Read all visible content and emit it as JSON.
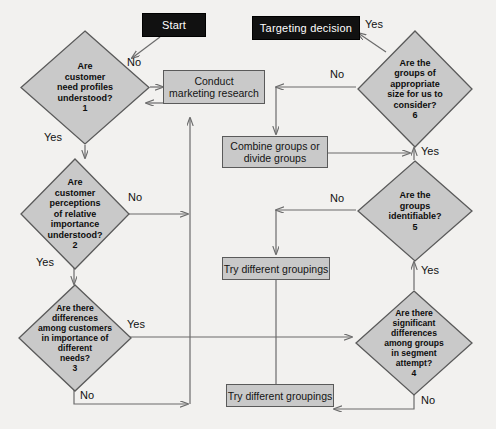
{
  "diagram": {
    "background_color": "#f2f1ef",
    "shape_fill": "#c9c9c9",
    "shape_stroke": "#5a5a5a",
    "terminator_fill": "#111111",
    "terminator_text_color": "#ffffff",
    "line_color": "#6b6b6b"
  },
  "terminators": [
    {
      "id": "start",
      "label": "Start"
    },
    {
      "id": "targeting-decision",
      "label": "Targeting decision"
    }
  ],
  "decisions": [
    {
      "id": "d1",
      "number": "1",
      "lines": [
        "Are",
        "customer",
        "need profiles",
        "understood?"
      ],
      "text": "Are customer need profiles understood? 1",
      "yes_label": "Yes",
      "no_label": "No"
    },
    {
      "id": "d2",
      "number": "2",
      "lines": [
        "Are",
        "customer",
        "perceptions",
        "of relative",
        "importance",
        "understood?"
      ],
      "text": "Are customer perceptions of relative importance understood? 2",
      "yes_label": "Yes",
      "no_label": "No"
    },
    {
      "id": "d3",
      "number": "3",
      "lines": [
        "Are there",
        "differences",
        "among customers",
        "in importance of",
        "different",
        "needs?"
      ],
      "text": "Are there differences among customers in importance of different needs? 3",
      "yes_label": "Yes",
      "no_label": "No"
    },
    {
      "id": "d4",
      "number": "4",
      "lines": [
        "Are there",
        "significant",
        "differences",
        "among groups",
        "in segment",
        "attempt?"
      ],
      "text": "Are there significant differences among groups in segment attempt? 4",
      "yes_label": "Yes",
      "no_label": "No"
    },
    {
      "id": "d5",
      "number": "5",
      "lines": [
        "Are the",
        "groups",
        "identifiable?"
      ],
      "text": "Are the groups identifiable? 5",
      "yes_label": "Yes",
      "no_label": "No"
    },
    {
      "id": "d6",
      "number": "6",
      "lines": [
        "Are the",
        "groups of",
        "appropriate",
        "size for us to",
        "consider?"
      ],
      "text": "Are the groups of appropriate size for us to consider? 6",
      "yes_label": "Yes",
      "no_label": "No"
    }
  ],
  "processes": [
    {
      "id": "p-research",
      "lines": [
        "Conduct",
        "marketing research"
      ],
      "text": "Conduct marketing research"
    },
    {
      "id": "p-combine",
      "lines": [
        "Combine groups or",
        "divide groups"
      ],
      "text": "Combine groups or divide groups"
    },
    {
      "id": "p-try-1",
      "lines": [
        "Try different groupings"
      ],
      "text": "Try different groupings"
    },
    {
      "id": "p-try-2",
      "lines": [
        "Try different groupings"
      ],
      "text": "Try different groupings"
    }
  ],
  "edge_labels": {
    "d1_no": "No",
    "d1_yes": "Yes",
    "d2_no": "No",
    "d2_yes": "Yes",
    "d3_yes": "Yes",
    "d3_no": "No",
    "d4_no": "No",
    "d4_yes": "Yes",
    "d5_no": "No",
    "d5_yes": "Yes",
    "d6_no": "No",
    "d6_yes": "Yes"
  }
}
